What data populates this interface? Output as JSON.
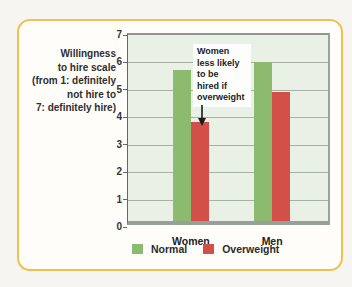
{
  "figure": {
    "axis_label_lines": [
      "Willingness",
      "to hire scale",
      "(from 1: definitely",
      "not hire to",
      "7: definitely hire)"
    ],
    "annotation_lines": [
      "Women",
      "less likely",
      "to be",
      "hired if",
      "overweight"
    ]
  },
  "chart_data": {
    "type": "bar",
    "title": "",
    "categories": [
      "Women",
      "Men"
    ],
    "series": [
      {
        "name": "Normal",
        "color": "#8cbb70",
        "values": [
          5.5,
          5.8
        ]
      },
      {
        "name": "Overweight",
        "color": "#d25048",
        "values": [
          3.6,
          4.7
        ]
      }
    ],
    "ylabel": "Willingness to hire scale (from 1: definitely not hire to 7: definitely hire)",
    "ylim": [
      0,
      7
    ],
    "yticks": [
      0,
      1,
      2,
      3,
      4,
      5,
      6,
      7
    ],
    "grid": true,
    "legend_position": "bottom",
    "annotation": "Women less likely to be hired if overweight"
  },
  "colors": {
    "card_border": "#eec04d",
    "plot_background": "#e9f1e6",
    "gridline": "#a7b2a7",
    "normal_bar": "#8cbb70",
    "overweight_bar": "#d25048"
  }
}
